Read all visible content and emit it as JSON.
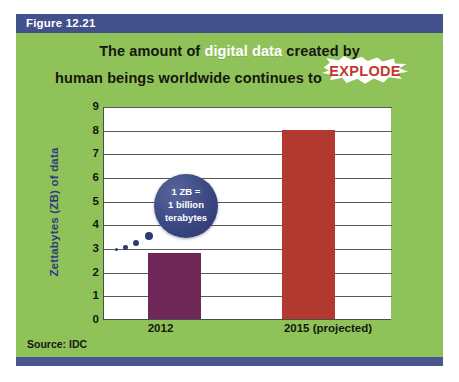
{
  "figure": {
    "header_label": "Figure 12.21",
    "source_text": "Source: IDC",
    "colors": {
      "panel_green": "#8fc359",
      "header_navy": "#42508c",
      "footer_navy": "#4a5690",
      "bar_2012": "#6e2757",
      "bar_2015": "#b1392f",
      "bubble_navy": "#3c4884",
      "explode_red": "#c0392b",
      "axis_title_blue": "#2e3c7e"
    }
  },
  "title": {
    "line1_pre": "The amount of ",
    "line1_highlight": "digital data",
    "line1_post": " created by",
    "line2_pre": "human beings worldwide continues to ",
    "line2_explode": "EXPLODE"
  },
  "callout": {
    "line1": "1 ZB =",
    "line2": "1 billion",
    "line3": "terabytes"
  },
  "chart_data": {
    "type": "bar",
    "title": "The amount of digital data created by human beings worldwide continues to EXPLODE",
    "categories": [
      "2012",
      "2015 (projected)"
    ],
    "values": [
      2.8,
      8.0
    ],
    "bar_colors": [
      "#6e2757",
      "#b1392f"
    ],
    "xlabel": "",
    "ylabel": "Zettabytes (ZB) of data",
    "ylim": [
      0,
      9
    ],
    "yticks": [
      "0",
      "1",
      "2",
      "3",
      "4",
      "5",
      "6",
      "7",
      "8",
      "9"
    ],
    "grid": true,
    "legend": "none",
    "annotations": [
      "1 ZB = 1 billion terabytes"
    ],
    "source": "Source: IDC"
  }
}
